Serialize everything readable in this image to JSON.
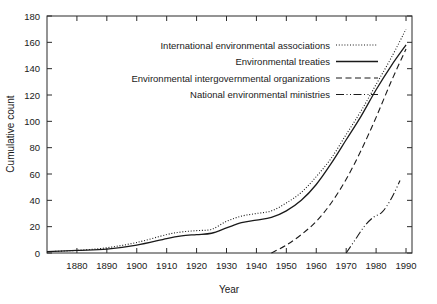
{
  "chart_data": {
    "type": "line",
    "title": "",
    "xlabel": "Year",
    "ylabel": "Cumulative count",
    "xlim": [
      1870,
      1992
    ],
    "ylim": [
      0,
      180
    ],
    "xticks": [
      1880,
      1890,
      1900,
      1910,
      1920,
      1930,
      1940,
      1950,
      1960,
      1970,
      1980,
      1990
    ],
    "yticks": [
      0,
      20,
      40,
      60,
      80,
      100,
      120,
      140,
      160,
      180
    ],
    "grid": false,
    "legend_position": "upper-left-inside",
    "series": [
      {
        "name": "International environmental associations",
        "style": "dotted",
        "x": [
          1870,
          1880,
          1890,
          1900,
          1910,
          1915,
          1920,
          1925,
          1930,
          1935,
          1940,
          1945,
          1950,
          1955,
          1960,
          1965,
          1970,
          1975,
          1980,
          1985,
          1990
        ],
        "values": [
          1,
          2,
          4,
          8,
          14,
          16,
          17,
          18,
          24,
          28,
          30,
          32,
          38,
          46,
          58,
          72,
          90,
          108,
          128,
          148,
          170
        ]
      },
      {
        "name": "Environmental treaties",
        "style": "solid",
        "x": [
          1870,
          1880,
          1890,
          1900,
          1910,
          1915,
          1920,
          1925,
          1930,
          1935,
          1940,
          1945,
          1950,
          1955,
          1960,
          1965,
          1970,
          1975,
          1980,
          1985,
          1990
        ],
        "values": [
          1,
          2,
          3,
          6,
          11,
          13,
          14,
          15,
          19,
          23,
          25,
          27,
          32,
          40,
          52,
          68,
          86,
          104,
          124,
          142,
          158
        ]
      },
      {
        "name": "Environmental intergovernmental organizations",
        "style": "dashed",
        "x": [
          1945,
          1950,
          1955,
          1960,
          1965,
          1970,
          1975,
          1980,
          1985,
          1990
        ],
        "values": [
          0,
          6,
          14,
          24,
          38,
          56,
          78,
          103,
          130,
          155
        ]
      },
      {
        "name": "National environmental ministries",
        "style": "dashdot",
        "x": [
          1970,
          1973,
          1976,
          1979,
          1982,
          1985,
          1988
        ],
        "values": [
          0,
          10,
          20,
          27,
          31,
          41,
          55
        ]
      }
    ]
  },
  "legend": {
    "items": [
      {
        "label": "International environmental associations",
        "style": "dotted"
      },
      {
        "label": "Environmental treaties",
        "style": "solid"
      },
      {
        "label": "Environmental intergovernmental organizations",
        "style": "dashed"
      },
      {
        "label": "National environmental ministries",
        "style": "dashdot"
      }
    ]
  }
}
